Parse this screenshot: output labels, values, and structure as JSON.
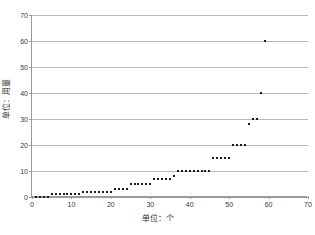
{
  "chart_data": {
    "type": "scatter",
    "title": "",
    "xlabel": "单位：个",
    "ylabel": "单位：用量",
    "xlim": [
      0,
      70
    ],
    "ylim": [
      0,
      70
    ],
    "xticks": [
      0,
      10,
      20,
      30,
      40,
      50,
      60,
      70
    ],
    "yticks": [
      0,
      10,
      20,
      30,
      40,
      50,
      60,
      70
    ],
    "grid": "horizontal",
    "legend": "none",
    "marker_color": "#1a1a1a",
    "gridline_color": "#b9b9b9",
    "series": [
      {
        "name": "用量",
        "x": [
          1,
          2,
          3,
          4,
          5,
          6,
          7,
          8,
          9,
          10,
          11,
          12,
          13,
          14,
          15,
          16,
          17,
          18,
          19,
          20,
          21,
          22,
          23,
          24,
          25,
          26,
          27,
          28,
          29,
          30,
          31,
          32,
          33,
          34,
          35,
          36,
          37,
          38,
          39,
          40,
          41,
          42,
          43,
          44,
          45,
          46,
          47,
          48,
          49,
          50,
          51,
          52,
          53,
          54,
          55,
          56,
          57,
          58,
          59
        ],
        "y": [
          0,
          0,
          0,
          0,
          1,
          1,
          1,
          1,
          1,
          1,
          1,
          1,
          2,
          2,
          2,
          2,
          2,
          2,
          2,
          2,
          3,
          3,
          3,
          3,
          5,
          5,
          5,
          5,
          5,
          5,
          7,
          7,
          7,
          7,
          7,
          8,
          10,
          10,
          10,
          10,
          10,
          10,
          10,
          10,
          10,
          15,
          15,
          15,
          15,
          15,
          20,
          20,
          20,
          20,
          28,
          30,
          30,
          40,
          60
        ]
      }
    ]
  },
  "axis": {
    "x_tick_labels": [
      "0",
      "10",
      "20",
      "30",
      "40",
      "50",
      "60",
      "70"
    ],
    "y_tick_labels": [
      "0",
      "10",
      "20",
      "30",
      "40",
      "50",
      "60",
      "70"
    ]
  }
}
